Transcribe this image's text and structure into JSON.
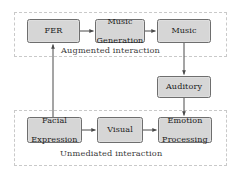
{
  "diagram": {
    "background_color": "#ffffff",
    "node_fill_color": "#d6d6d6",
    "node_border_color": "#6e6e6e",
    "group_border_color": "#c9c9c9",
    "edge_color": "#4a4a4a"
  },
  "groups": [
    {
      "id": "augmented",
      "label": "Augmented interaction"
    },
    {
      "id": "unmediated",
      "label": "Unmediated interaction"
    }
  ],
  "nodes": [
    {
      "id": "fer",
      "label": "FER"
    },
    {
      "id": "music_generation",
      "label": "Music\nGeneration",
      "line1": "Music",
      "line2": "Generation"
    },
    {
      "id": "music",
      "label": "Music"
    },
    {
      "id": "auditory",
      "label": "Auditory"
    },
    {
      "id": "facial_expression",
      "label": "Facial\nExpression",
      "line1": "Facial",
      "line2": "Expression"
    },
    {
      "id": "visual",
      "label": "Visual"
    },
    {
      "id": "emotion_processing",
      "label": "Emotion\nProcessing",
      "line1": "Emotion",
      "line2": "Processing"
    }
  ],
  "edges": [
    {
      "from": "fer",
      "to": "music_generation",
      "direction": "right"
    },
    {
      "from": "music_generation",
      "to": "music",
      "direction": "right"
    },
    {
      "from": "music",
      "to": "auditory",
      "direction": "down"
    },
    {
      "from": "auditory",
      "to": "emotion_processing",
      "direction": "down"
    },
    {
      "from": "facial_expression",
      "to": "fer",
      "direction": "up"
    },
    {
      "from": "facial_expression",
      "to": "visual",
      "direction": "right"
    },
    {
      "from": "visual",
      "to": "emotion_processing",
      "direction": "right"
    }
  ]
}
